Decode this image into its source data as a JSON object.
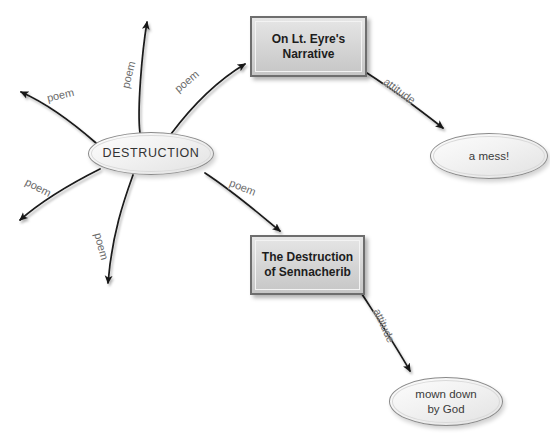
{
  "diagram": {
    "type": "concept-map",
    "title_subject": "DESTRUCTION",
    "background_color": "#ffffff",
    "edge_color": "#1a1a1a",
    "label_color": "#6a6a6a",
    "node_fill_box": "#d4d4d4",
    "node_fill_ellipse": "#f2f2f2"
  },
  "nodes": {
    "central": {
      "label": "DESTRUCTION",
      "shape": "ellipse"
    },
    "box_eyre": {
      "label": "On Lt. Eyre's\nNarrative",
      "shape": "rectangle"
    },
    "box_sennacherib": {
      "label": "The Destruction\nof Sennacherib",
      "shape": "rectangle"
    },
    "ellipse_mess": {
      "label": "a mess!",
      "shape": "ellipse"
    },
    "ellipse_mown": {
      "label": "mown down\nby God",
      "shape": "ellipse"
    }
  },
  "edges": [
    {
      "id": "poem-upper-left",
      "label": "poem",
      "from": "central",
      "to": "open-arrow-upper-left"
    },
    {
      "id": "poem-up",
      "label": "poem",
      "from": "central",
      "to": "open-arrow-up"
    },
    {
      "id": "poem-to-eyre",
      "label": "poem",
      "from": "central",
      "to": "box_eyre"
    },
    {
      "id": "poem-to-senn",
      "label": "poem",
      "from": "central",
      "to": "box_sennacherib"
    },
    {
      "id": "poem-lower-left",
      "label": "poem",
      "from": "central",
      "to": "open-arrow-lower-left"
    },
    {
      "id": "poem-down",
      "label": "poem",
      "from": "central",
      "to": "open-arrow-down"
    },
    {
      "id": "attitude-mess",
      "label": "attitude",
      "from": "box_eyre",
      "to": "ellipse_mess"
    },
    {
      "id": "attitude-mown",
      "label": "attitude",
      "from": "box_sennacherib",
      "to": "ellipse_mown"
    }
  ]
}
